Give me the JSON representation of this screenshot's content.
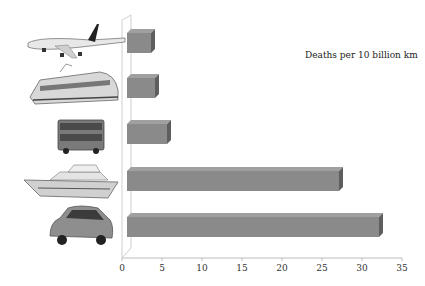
{
  "chart_data": {
    "type": "bar",
    "orientation": "horizontal",
    "style": "3d",
    "title": "",
    "annotation": "Deaths per 10 billion km",
    "categories": [
      "Car",
      "Ship",
      "Bus",
      "Train",
      "Plane"
    ],
    "category_icons": [
      "car-icon",
      "ship-icon",
      "bus-icon",
      "train-icon",
      "plane-icon"
    ],
    "values": [
      31.5,
      26.5,
      5,
      3.5,
      3
    ],
    "xlabel": "",
    "ylabel": "",
    "xlim": [
      0,
      35
    ],
    "xticks": [
      "0",
      "5",
      "10",
      "15",
      "20",
      "25",
      "30",
      "35"
    ],
    "grid": false,
    "legend": "none",
    "bar_color": "#8a8a8a"
  }
}
